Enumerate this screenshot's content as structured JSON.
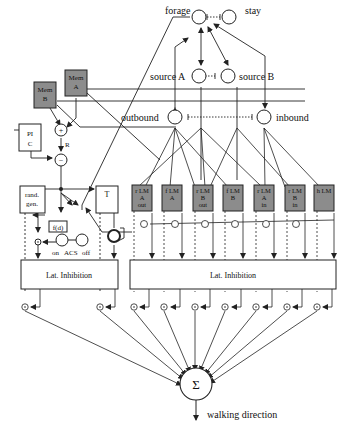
{
  "diagram": {
    "colors": {
      "line": "#222222",
      "box_fill": "#8c8c8c",
      "background": "#ffffff"
    },
    "top_nodes": {
      "forage": "forage",
      "stay": "stay",
      "source_a": "source A",
      "source_b": "source B",
      "outbound": "outbound",
      "inbound": "inbound"
    },
    "memory": {
      "mem_a_line1": "Mem",
      "mem_a_line2": "A",
      "mem_b_line1": "Mem",
      "mem_b_line2": "B"
    },
    "pi": {
      "line1": "PI",
      "line2": "C"
    },
    "ops": {
      "plus": "+",
      "minus": "−",
      "r_label": "R"
    },
    "rand_gen": {
      "line1": "rand.",
      "line2": "gen."
    },
    "t_box": "T",
    "fd": "f(d)",
    "acs": {
      "on": "on",
      "label": "ACS",
      "off": "off"
    },
    "landmarks": [
      {
        "l1": "r LM",
        "l2": "A",
        "l3": "out"
      },
      {
        "l1": "f LM",
        "l2": "A",
        "l3": ""
      },
      {
        "l1": "r LM",
        "l2": "B",
        "l3": "out"
      },
      {
        "l1": "f LM",
        "l2": "B",
        "l3": ""
      },
      {
        "l1": "r LM",
        "l2": "A",
        "l3": "in"
      },
      {
        "l1": "r LM",
        "l2": "B",
        "l3": "in"
      },
      {
        "l1": "h LM",
        "l2": "",
        "l3": ""
      }
    ],
    "lat_inhibition_left": "Lat. Inhibition",
    "lat_inhibition_right": "Lat. Inhibition",
    "sum_symbol": "Σ",
    "output_label": "walking direction"
  }
}
